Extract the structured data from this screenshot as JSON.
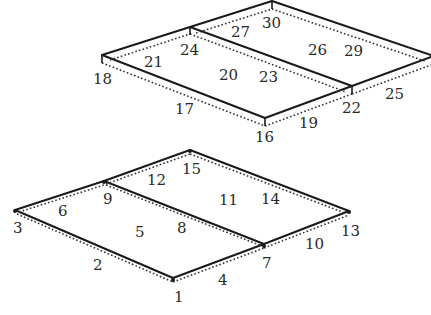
{
  "diagram": {
    "colors": {
      "line": "#1a1a1a",
      "label": "#2a2a2a",
      "background": "#ffffff"
    },
    "top_structure": {
      "labels": {
        "n16": "16",
        "n17": "17",
        "n18": "18",
        "n19": "19",
        "n20": "20",
        "n21": "21",
        "n22": "22",
        "n23": "23",
        "n24": "24",
        "n25": "25",
        "n26": "26",
        "n27": "27",
        "n29": "29",
        "n30": "30"
      }
    },
    "bottom_structure": {
      "labels": {
        "n1": "1",
        "n2": "2",
        "n3": "3",
        "n4": "4",
        "n5": "5",
        "n6": "6",
        "n7": "7",
        "n8": "8",
        "n9": "9",
        "n10": "10",
        "n11": "11",
        "n12": "12",
        "n13": "13",
        "n14": "14",
        "n15": "15"
      }
    }
  }
}
